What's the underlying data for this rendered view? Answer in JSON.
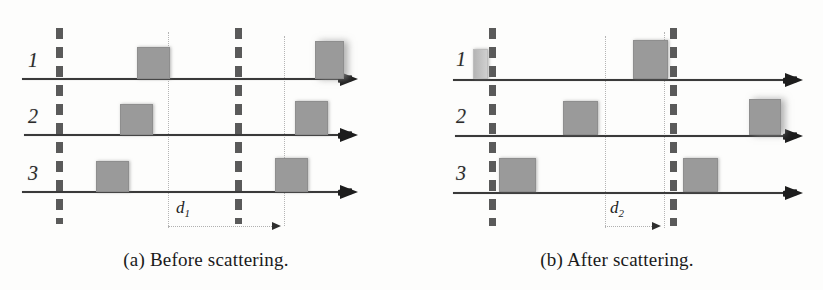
{
  "figure": {
    "type": "scattering-pulse-diagram",
    "panels": [
      {
        "id": "a",
        "caption": "(a) Before scattering.",
        "row_labels": [
          "1",
          "2",
          "3"
        ],
        "dimension": {
          "label": "d",
          "subscript": "1"
        }
      },
      {
        "id": "b",
        "caption": "(b) After scattering.",
        "row_labels": [
          "1",
          "2",
          "3"
        ],
        "dimension": {
          "label": "d",
          "subscript": "2"
        }
      }
    ]
  },
  "colors": {
    "block_fill": "#9a9a9a",
    "block_fill_faded": "#c4c4c4",
    "barrier": "#5a5a5a",
    "axis": "#3a3a3a",
    "guide": "#b5b5b5",
    "text": "#1a1a1a",
    "background": "#fdfdfc"
  }
}
